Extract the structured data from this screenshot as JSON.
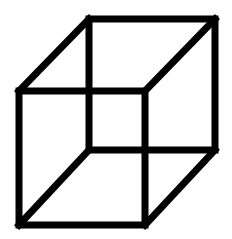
{
  "figure": {
    "stroke_color": "#000000",
    "background": "#ffffff",
    "stroke_width": 7,
    "back_face": {
      "tl": [
        89,
        19
      ],
      "tr": [
        215,
        19
      ],
      "br": [
        215,
        150
      ],
      "bl": [
        89,
        150
      ]
    },
    "front_face": {
      "tl": [
        19,
        91
      ],
      "tr": [
        145,
        91
      ],
      "br": [
        145,
        225
      ],
      "bl": [
        19,
        225
      ]
    }
  }
}
